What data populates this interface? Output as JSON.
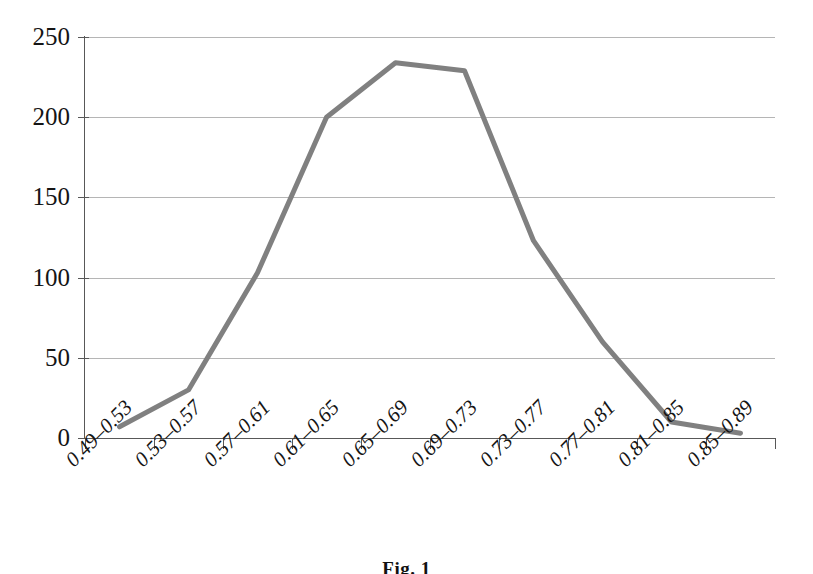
{
  "caption": "Fig. 1",
  "chart_data": {
    "type": "line",
    "title": "",
    "subtitle": "",
    "xlabel": "",
    "ylabel": "",
    "categories": [
      "0.49–0.53",
      "0.53–0.57",
      "0.57–0.61",
      "0.61–0.65",
      "0.65–0.69",
      "0.69–0.73",
      "0.73–0.77",
      "0.77–0.81",
      "0.81–0.85",
      "0.85–0.89"
    ],
    "values": [
      7,
      30,
      103,
      200,
      234,
      229,
      123,
      60,
      10,
      3
    ],
    "ylim": [
      0,
      250
    ],
    "y_ticks": [
      0,
      50,
      100,
      150,
      200,
      250
    ],
    "y_tick_labels": [
      "0",
      "50",
      "100",
      "150",
      "200",
      "250"
    ],
    "grid": true,
    "legend": false,
    "legend_position": "none",
    "series": [
      {
        "name": "frequency",
        "color": "#808080",
        "line_width": 5,
        "markers": false,
        "values": [
          7,
          30,
          103,
          200,
          234,
          229,
          123,
          60,
          10,
          3
        ]
      }
    ],
    "colors": {
      "line": "#808080",
      "grid": "#b5b5b5",
      "axis": "#585858",
      "text": "#151515",
      "background": "#ffffff"
    }
  }
}
